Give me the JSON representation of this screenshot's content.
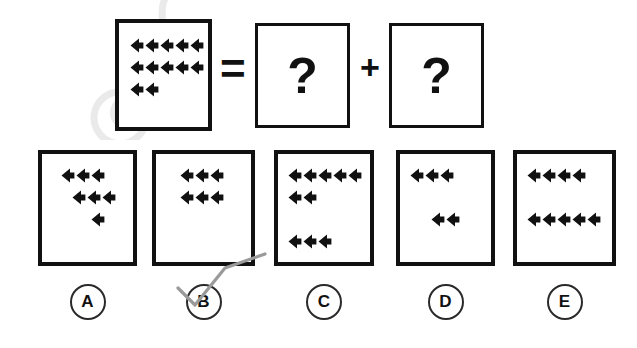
{
  "puzzle": {
    "type": "visual-analogy-iq-question",
    "icon_name": "speaker-left-triangle",
    "operators": {
      "equals": "=",
      "plus": "+"
    },
    "question_mark": "?",
    "prompt_box": {
      "name": "prompt-quantity-box",
      "total_shapes": 12,
      "rows": [
        {
          "count": 5,
          "indent": 0
        },
        {
          "count": 5,
          "indent": 0
        },
        {
          "count": 2,
          "indent": 0
        }
      ]
    },
    "unknown_boxes": [
      {
        "name": "first-unknown-box",
        "symbol": "?"
      },
      {
        "name": "second-unknown-box",
        "symbol": "?"
      }
    ],
    "answers": [
      {
        "label": "A",
        "total_shapes": 7,
        "rows": [
          {
            "count": 3,
            "indent": 0.6
          },
          {
            "count": 3,
            "indent": 1.3
          },
          {
            "count": 1,
            "indent": 2.6
          }
        ]
      },
      {
        "label": "B",
        "total_shapes": 6,
        "rows": [
          {
            "count": 3,
            "indent": 0.9
          },
          {
            "count": 3,
            "indent": 0.9
          }
        ]
      },
      {
        "label": "C",
        "total_shapes": 10,
        "rows": [
          {
            "count": 5,
            "indent": 0
          },
          {
            "count": 2,
            "indent": 0
          },
          {
            "count": 0,
            "indent": 0
          },
          {
            "count": 3,
            "indent": 0
          }
        ]
      },
      {
        "label": "D",
        "total_shapes": 5,
        "rows": [
          {
            "count": 3,
            "indent": 0
          },
          {
            "count": 0,
            "indent": 0
          },
          {
            "count": 2,
            "indent": 1.4
          }
        ]
      },
      {
        "label": "E",
        "total_shapes": 9,
        "rows": [
          {
            "count": 4,
            "indent": 0
          },
          {
            "count": 0,
            "indent": 0
          },
          {
            "count": 5,
            "indent": 0
          }
        ]
      }
    ],
    "annotation": {
      "name": "handwritten-check-mark",
      "over_label": "B",
      "color": "#9a9a9a"
    },
    "watermark": {
      "text": "@",
      "color": "#e8e8e8"
    }
  },
  "colors": {
    "ink": "#111111",
    "outline": "#2a2a2a",
    "paper": "#ffffff",
    "pen": "#9a9a9a",
    "watermark": "#e9e9e9"
  }
}
